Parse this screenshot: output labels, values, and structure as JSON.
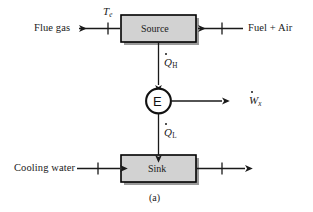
{
  "figure": {
    "caption": "(a)",
    "type": "energy-flow-block-diagram",
    "colors": {
      "box_fill": "#d2d2d2",
      "box_stroke": "#000000",
      "shadow": "#9a9a9a",
      "line": "#1a1a1a",
      "background": "#ffffff"
    }
  },
  "blocks": {
    "source": {
      "label": "Source"
    },
    "sink": {
      "label": "Sink"
    },
    "engine": {
      "label": "E"
    }
  },
  "streams": {
    "flue_gas": {
      "label": "Flue gas",
      "direction": "left",
      "has_tick": true
    },
    "fuel_air": {
      "label": "Fuel + Air",
      "direction": "left",
      "has_tick": true
    },
    "cooling_water_in": {
      "label": "Cooling water",
      "direction": "right",
      "has_tick": true
    },
    "cooling_water_out": {
      "label": "",
      "direction": "right",
      "has_tick": true
    }
  },
  "symbols": {
    "temperature": {
      "base": "T",
      "subscript": "e",
      "dot": false
    },
    "heat_high": {
      "base": "Q",
      "subscript": "H",
      "dot": true
    },
    "heat_low": {
      "base": "Q",
      "subscript": "L",
      "dot": true
    },
    "work": {
      "base": "W",
      "subscript": "x",
      "dot": true
    }
  }
}
